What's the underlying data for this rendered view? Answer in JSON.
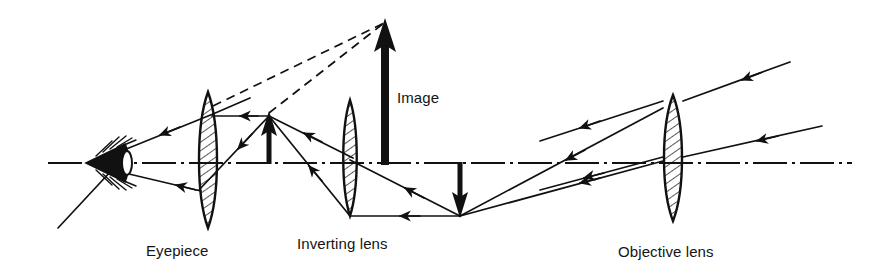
{
  "diagram": {
    "type": "optical-ray-diagram",
    "background_color": "#ffffff",
    "ink_color": "#111111",
    "labels": {
      "eyepiece": "Eyepiece",
      "inverting_lens": "Inverting lens",
      "objective_lens": "Objective lens",
      "image": "Image"
    },
    "label_positions": {
      "eyepiece": {
        "x": 146,
        "y": 256
      },
      "inverting_lens": {
        "x": 297,
        "y": 249
      },
      "objective_lens": {
        "x": 618,
        "y": 257
      },
      "image": {
        "x": 397,
        "y": 103
      }
    },
    "optical_axis": {
      "name": "optical-axis",
      "style": "dash-dot",
      "y": 163,
      "x_start": 48,
      "x_end": 852
    },
    "eye": {
      "name": "observer-eye",
      "x": 88,
      "y": 163,
      "width": 55,
      "height": 46,
      "description": "stylized eye with lashes at far left on the optical axis"
    },
    "lenses": [
      {
        "name": "eyepiece-lens",
        "label": "Eyepiece",
        "center_x": 208,
        "center_y": 160,
        "half_height": 68,
        "half_width": 11,
        "hatched": true
      },
      {
        "name": "inverting-lens",
        "label": "Inverting lens",
        "center_x": 350,
        "center_y": 158,
        "half_height": 58,
        "half_width": 8,
        "hatched": true
      },
      {
        "name": "objective-lens",
        "label": "Objective lens",
        "center_x": 673,
        "center_y": 158,
        "half_height": 63,
        "half_width": 11,
        "hatched": true
      }
    ],
    "arrows": [
      {
        "name": "virtual-image-arrow",
        "label": "Image",
        "x": 385,
        "y_base": 165,
        "y_tip": 20,
        "direction": "up",
        "weight": "thick",
        "description": "large upright virtual image arrow"
      },
      {
        "name": "intermediate-erect-image-arrow",
        "x": 269,
        "y_base": 164,
        "y_tip": 113,
        "direction": "up",
        "weight": "medium",
        "description": "erect intermediate image formed by inverting lens"
      },
      {
        "name": "inverted-image-arrow",
        "x": 460,
        "y_base": 162,
        "y_tip": 216,
        "direction": "down",
        "weight": "medium",
        "description": "inverted real image formed by objective lens"
      }
    ],
    "rays": [
      {
        "name": "ray-objective-upper-incoming",
        "points": "790,62 683,101",
        "arrow_at": 0.5
      },
      {
        "name": "ray-objective-upper-through",
        "points": "663,108 460,216",
        "arrow_at": 0.55
      },
      {
        "name": "ray-objective-lower-incoming",
        "points": "820,125 683,156",
        "arrow_at": 0.5
      },
      {
        "name": "ray-objective-axis-through",
        "points": "663,160 460,216",
        "arrow_at": 0.55
      },
      {
        "name": "ray-inverted-to-inverting-horizontal",
        "points": "460,216 350,216",
        "arrow_at": 0.5
      },
      {
        "name": "ray-inverted-to-inverting-upper",
        "points": "460,216 350,160",
        "arrow_at": 0.5
      },
      {
        "name": "ray-inverting-to-erect-lower",
        "points": "350,216 269,116",
        "arrow_at": 0.45
      },
      {
        "name": "ray-inverting-to-erect-upper",
        "points": "352,158 269,116",
        "arrow_at": 0.5
      },
      {
        "name": "ray-erect-to-eyepiece-horizontal",
        "points": "269,116 213,116",
        "arrow_at": 0.5
      },
      {
        "name": "ray-erect-to-eyepiece-lower",
        "points": "269,116 201,188",
        "arrow_at": 0.5
      },
      {
        "name": "ray-eyepiece-to-eye-upper",
        "points": "213,116 112,157",
        "arrow_at": 0.55
      },
      {
        "name": "ray-eyepiece-to-eye-lower",
        "points": "201,188 112,168",
        "arrow_at": 0.55
      },
      {
        "name": "ray-eye-extension-upper",
        "points": "112,157 180,130",
        "arrow_at": null
      },
      {
        "name": "ray-eye-extension-lower",
        "points": "112,168 60,226",
        "arrow_at": null
      }
    ],
    "construction_lines": [
      {
        "name": "dashed-line-from-eyepiece-top",
        "style": "dashed",
        "points": "213,105 385,22",
        "description": "virtual ray traced back to image tip"
      },
      {
        "name": "dashed-line-from-erect-image-tip",
        "style": "dashed",
        "points": "269,113 385,22",
        "description": "virtual ray traced back to image tip"
      }
    ]
  }
}
